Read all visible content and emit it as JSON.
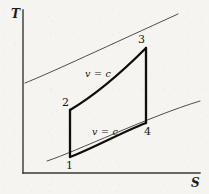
{
  "figure": {
    "type": "thermodynamic-ts-diagram",
    "background_color": "#f6f4f1",
    "ink_color": "#17150f"
  },
  "axes": {
    "y_label": "T",
    "x_label": "S",
    "y_axis": {
      "x": 23,
      "y_top": 10,
      "y_bottom": 173
    },
    "x_axis": {
      "y": 173,
      "x_left": 23,
      "x_right": 200
    },
    "line_color": "#3a3733",
    "line_width": 1.4,
    "ticks": [],
    "grid": false
  },
  "states": [
    {
      "id": "1",
      "label": "1",
      "x": 70,
      "y": 157,
      "label_x": 66,
      "label_y": 160
    },
    {
      "id": "2",
      "label": "2",
      "x": 70,
      "y": 110,
      "label_x": 62,
      "label_y": 97
    },
    {
      "id": "3",
      "label": "3",
      "x": 146,
      "y": 48,
      "label_x": 138,
      "label_y": 34
    },
    {
      "id": "4",
      "label": "4",
      "x": 146,
      "y": 123,
      "label_x": 144,
      "label_y": 126
    }
  ],
  "processes": [
    {
      "name": "compression-1-2",
      "from": "1",
      "to": "2",
      "kind": "isentropic",
      "style": "thick-vertical",
      "path": "M 70 157 L 70 110"
    },
    {
      "name": "heat-addition-2-3",
      "from": "2",
      "to": "3",
      "kind": "constant-volume",
      "label": "v = c",
      "style": "thick-curve",
      "path": "M 70 110 C 92 97, 118 76, 146 48"
    },
    {
      "name": "expansion-3-4",
      "from": "3",
      "to": "4",
      "kind": "isentropic",
      "style": "thick-vertical",
      "path": "M 146 48 L 146 123"
    },
    {
      "name": "heat-rejection-4-1",
      "from": "4",
      "to": "1",
      "kind": "constant-volume",
      "label": "v = c",
      "style": "thick-curve",
      "path": "M 146 123 C 120 133, 94 148, 70 157"
    }
  ],
  "isochores": [
    {
      "name": "upper-isochore",
      "style": "thin-curve",
      "path": "M 25 83 C 48 74, 112 44, 178 14"
    },
    {
      "name": "lower-isochore",
      "style": "thin-curve",
      "path": "M 47 161 C 75 152, 150 116, 200 101"
    }
  ],
  "process_labels": [
    {
      "id": "upper-vc",
      "text": "v = c",
      "x": 85,
      "y": 69
    },
    {
      "id": "lower-vc",
      "text": "v = c",
      "x": 92,
      "y": 127
    }
  ],
  "line_weights": {
    "thin": 0.9,
    "thick": 2.3
  }
}
